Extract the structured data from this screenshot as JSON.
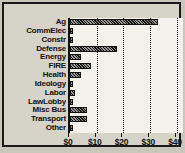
{
  "chart_data": {
    "type": "bar",
    "orientation": "horizontal",
    "title": "",
    "xlabel": "",
    "ylabel": "",
    "categories": [
      "Ag",
      "CommElec",
      "Constr",
      "Defense",
      "Energy",
      "FIRE",
      "Health",
      "Ideology",
      "Labor",
      "LawLobby",
      "Misc Bus",
      "Transport",
      "Other"
    ],
    "values": [
      33,
      0.6,
      0.6,
      17.5,
      4,
      8,
      4,
      1,
      2,
      0.3,
      6.5,
      6.5,
      1
    ],
    "xlim": [
      0,
      43
    ],
    "xticks": [
      0,
      10,
      20,
      30,
      40
    ],
    "xticklabels": [
      "$0",
      "$10",
      "$20",
      "$30",
      "$40"
    ],
    "grid": "vertical-dotted",
    "legend": "none",
    "bar_color": "#151513",
    "bar_pattern": "hatched",
    "panel_bg": "#f4f2ec",
    "figure_bg": "#d6d3c9",
    "frame_color": "#1a1a18"
  }
}
